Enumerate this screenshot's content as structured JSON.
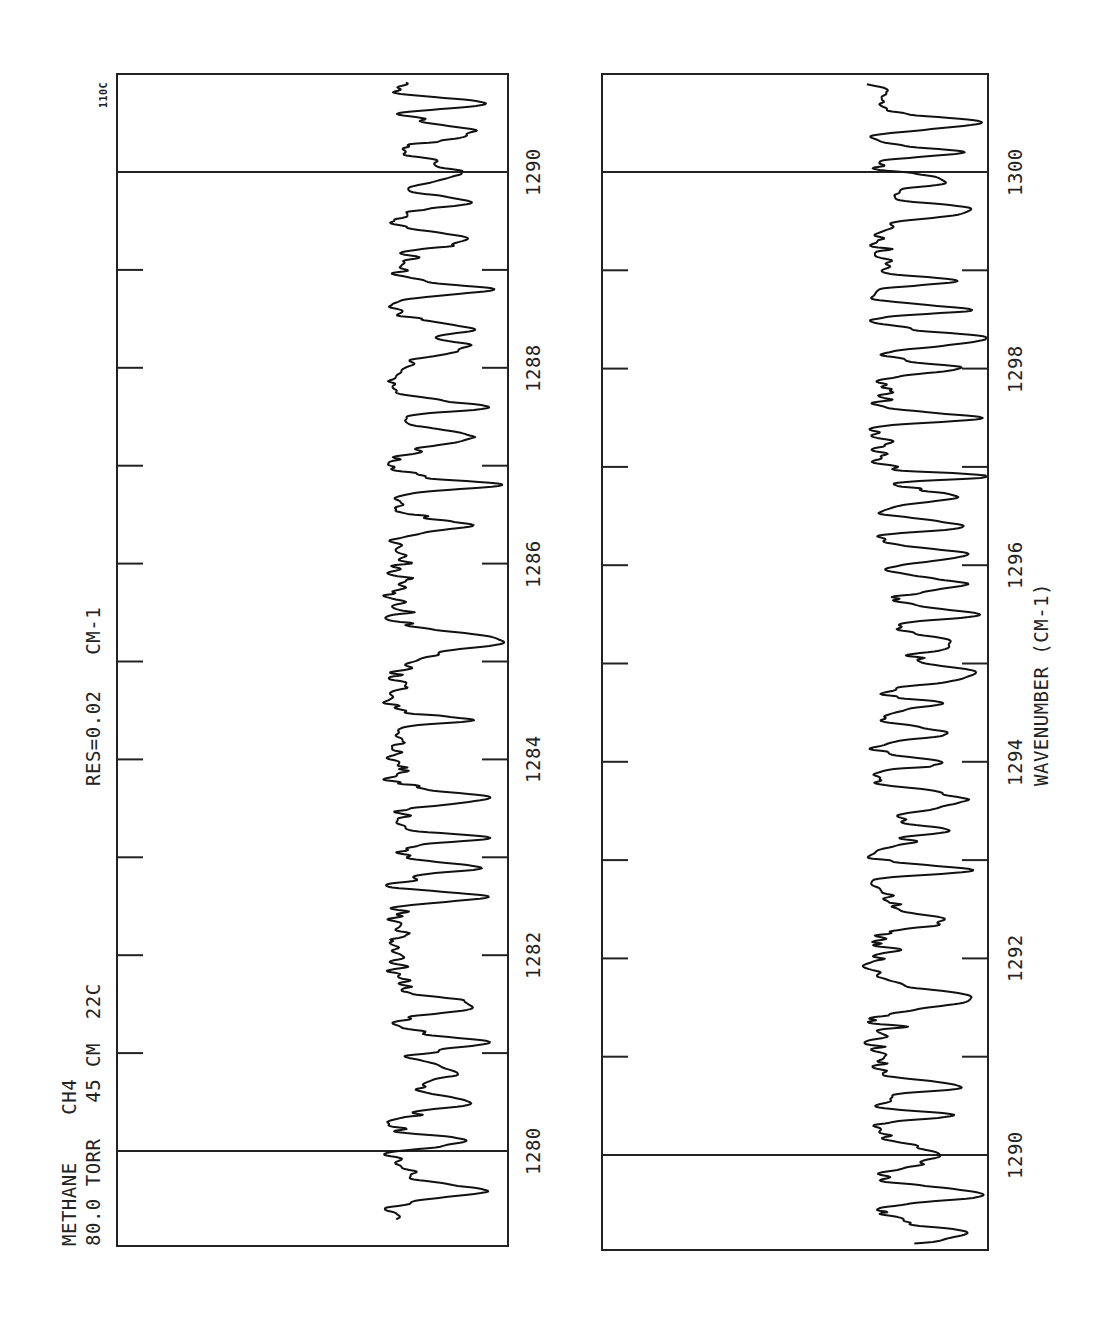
{
  "chart_data": [
    {
      "type": "line",
      "title": "METHANE CH4 absorption spectrum (panel 1)",
      "header": {
        "line1": "METHANE    CH4",
        "line2": "80.0 TORR   45 CM  22C",
        "resolution": "RES=0.02   CM-1",
        "corner_label": "110C"
      },
      "xlabel": "",
      "ylabel": "",
      "xlim": [
        1279.3,
        1291.0
      ],
      "orientation": "rotated-90 (wavenumber increases upward)",
      "major_ticks": [
        1280,
        1282,
        1284,
        1286,
        1288,
        1290
      ],
      "tick_labels": [
        "1280",
        "1282",
        "1284",
        "1286",
        "1288",
        "1290"
      ],
      "reference_lines": [
        1280,
        1290
      ],
      "minor_ticks": [
        1281,
        1283,
        1285,
        1287,
        1289
      ],
      "grid": false,
      "strong_absorption_lines": [
        1279.6,
        1280.1,
        1280.5,
        1280.8,
        1281.1,
        1281.5,
        1282.6,
        1282.9,
        1283.2,
        1283.6,
        1284.4,
        1285.2,
        1286.4,
        1286.8,
        1287.3,
        1287.6,
        1288.2,
        1288.4,
        1288.8,
        1289.3,
        1289.7,
        1290.0,
        1290.4,
        1290.7
      ]
    },
    {
      "type": "line",
      "title": "METHANE CH4 absorption spectrum (panel 2)",
      "xlabel": "WAVENUMBER (CM-1)",
      "ylabel": "",
      "xlim": [
        1289.1,
        1300.9
      ],
      "orientation": "rotated-90 (wavenumber increases upward)",
      "major_ticks": [
        1290,
        1292,
        1294,
        1296,
        1298,
        1300
      ],
      "tick_labels": [
        "1290",
        "1292",
        "1294",
        "1296",
        "1298",
        "1300"
      ],
      "reference_lines": [
        1290,
        1300
      ],
      "minor_ticks": [
        1291,
        1293,
        1295,
        1297,
        1299
      ],
      "grid": false,
      "strong_absorption_lines": [
        1289.2,
        1289.6,
        1290.0,
        1290.4,
        1290.7,
        1291.6,
        1292.4,
        1292.9,
        1293.3,
        1293.6,
        1294.0,
        1294.3,
        1294.6,
        1294.9,
        1295.2,
        1295.5,
        1295.8,
        1296.1,
        1296.4,
        1296.7,
        1296.9,
        1297.5,
        1298.0,
        1298.3,
        1298.6,
        1298.9,
        1299.6,
        1299.9,
        1300.2,
        1300.5
      ]
    }
  ]
}
